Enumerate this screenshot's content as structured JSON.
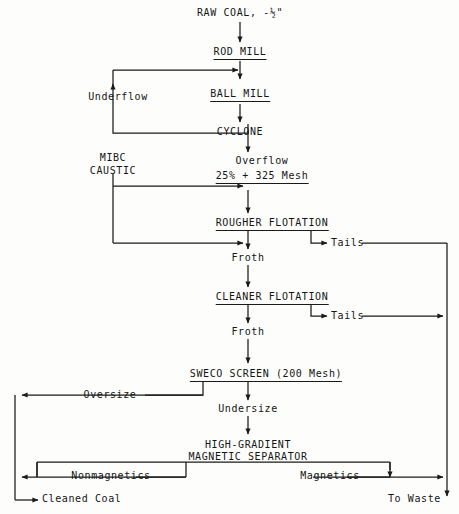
{
  "diagram": {
    "line_color": "#1a1a1a",
    "background": "#fdfdfb"
  },
  "nodes": {
    "feed": "RAW COAL, -½\"",
    "rod_mill": "ROD MILL",
    "ball_mill": "BALL MILL",
    "cyclone": "CYCLONE",
    "rougher": "ROUGHER FLOTATION",
    "cleaner": "CLEANER FLOTATION",
    "sweco": "SWECO SCREEN (200 Mesh)",
    "separator_line1": "HIGH-GRADIENT",
    "separator_line2": "MAGNETIC SEPARATOR"
  },
  "streams": {
    "underflow": "Underflow",
    "overflow": "Overflow",
    "overflow_spec": "25% + 325 Mesh",
    "reagent_line1": "MIBC",
    "reagent_line2": "CAUSTIC",
    "rougher_froth": "Froth",
    "rougher_tails": "Tails",
    "cleaner_froth": "Froth",
    "cleaner_tails": "Tails",
    "oversize": "Oversize",
    "undersize": "Undersize",
    "nonmagnetics": "Nonmagnetics",
    "magnetics": "Magnetics"
  },
  "products": {
    "cleaned_coal": "Cleaned Coal",
    "to_waste": "To Waste"
  }
}
